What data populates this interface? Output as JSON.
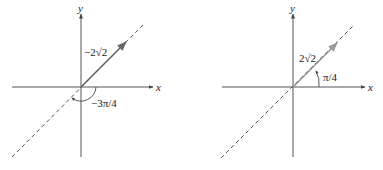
{
  "diagrams": [
    {
      "id": "left",
      "x_axis_label": "x",
      "y_axis_label": "y",
      "magnitude_label": "−2√2",
      "angle_label": "−3π/4",
      "colors": {
        "axes": "#555555",
        "vector": "#666666",
        "dashed": "#555555"
      }
    },
    {
      "id": "right",
      "x_axis_label": "x",
      "y_axis_label": "y",
      "magnitude_label": "2√2",
      "angle_label": "π/4",
      "colors": {
        "axes": "#555555",
        "vector": "#999999",
        "dashed": "#555555"
      }
    }
  ]
}
